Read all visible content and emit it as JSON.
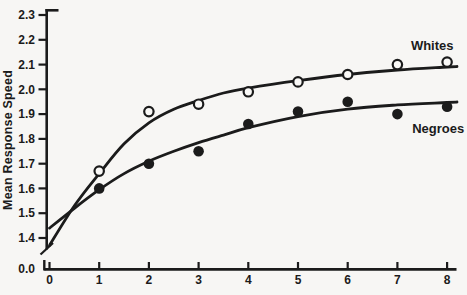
{
  "chart_data": {
    "type": "line",
    "title": "",
    "xlabel": "",
    "ylabel": "Mean Response Speed",
    "xlim": [
      0,
      8
    ],
    "ylim": [
      1.4,
      2.3
    ],
    "grid": false,
    "legend": "inline-labels",
    "y_axis_break": true,
    "y_break_label": "0.0",
    "x_tick_labels": [
      "0",
      "1",
      "2",
      "3",
      "4",
      "5",
      "6",
      "7",
      "8"
    ],
    "y_tick_labels": [
      "2.3",
      "2.2",
      "2.1",
      "2.0",
      "1.9",
      "1.8",
      "1.7",
      "1.6",
      "1.5",
      "1.4"
    ],
    "series": [
      {
        "name": "Whites",
        "marker": "open-circle",
        "x": [
          1,
          2,
          3,
          4,
          5,
          6,
          7,
          8
        ],
        "values": [
          1.67,
          1.91,
          1.94,
          1.99,
          2.03,
          2.06,
          2.1,
          2.11
        ],
        "fitted_curve": [
          [
            0,
            1.37
          ],
          [
            0.5,
            1.53
          ],
          [
            1,
            1.66
          ],
          [
            1.5,
            1.78
          ],
          [
            2,
            1.865
          ],
          [
            2.5,
            1.92
          ],
          [
            3,
            1.955
          ],
          [
            3.5,
            1.985
          ],
          [
            4,
            2.005
          ],
          [
            5,
            2.035
          ],
          [
            6,
            2.06
          ],
          [
            7,
            2.078
          ],
          [
            8,
            2.09
          ],
          [
            8.2,
            2.092
          ]
        ],
        "label": "Whites",
        "label_anchor": {
          "x": 7.7,
          "v": 2.175
        }
      },
      {
        "name": "Negroes",
        "marker": "filled-circle",
        "x": [
          1,
          2,
          3,
          4,
          5,
          6,
          7,
          8
        ],
        "values": [
          1.6,
          1.7,
          1.75,
          1.86,
          1.91,
          1.95,
          1.9,
          1.93
        ],
        "fitted_curve": [
          [
            0,
            1.44
          ],
          [
            0.5,
            1.52
          ],
          [
            1,
            1.595
          ],
          [
            1.5,
            1.66
          ],
          [
            2,
            1.71
          ],
          [
            2.5,
            1.75
          ],
          [
            3,
            1.785
          ],
          [
            3.5,
            1.815
          ],
          [
            4,
            1.845
          ],
          [
            5,
            1.89
          ],
          [
            6,
            1.92
          ],
          [
            7,
            1.937
          ],
          [
            8,
            1.947
          ],
          [
            8.2,
            1.949
          ]
        ],
        "label": "Negroes",
        "label_anchor": {
          "x": 7.82,
          "v": 1.84
        }
      }
    ],
    "colors": {
      "ink": "#1b1b1b",
      "background": "#f7f6f4",
      "open_marker_fill": "#faf9f7"
    }
  }
}
